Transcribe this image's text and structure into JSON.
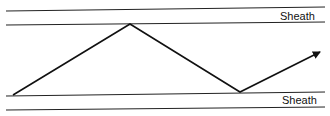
{
  "diagram": {
    "title": "",
    "labels": {
      "top_sheath": "Sheath",
      "bottom_sheath": "Sheath"
    },
    "lines": {
      "top_outer_y": 10,
      "top_inner_y": 24,
      "bottom_inner_y": 95,
      "bottom_outer_y": 108
    },
    "path": [
      [
        13,
        95
      ],
      [
        130,
        24
      ],
      [
        240,
        92
      ],
      [
        320,
        52
      ]
    ],
    "colors": {
      "stroke": "#111111",
      "background": "#ffffff"
    }
  }
}
